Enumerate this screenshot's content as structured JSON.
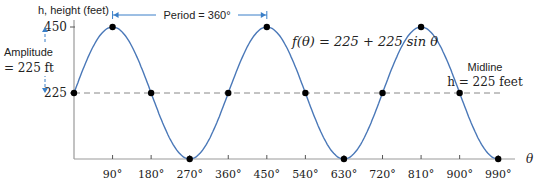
{
  "chart_data": {
    "type": "line",
    "title": "",
    "function_label": "f(θ) = 225 + 225 sin θ",
    "xlabel": "θ",
    "ylabel": "h, height (feet)",
    "xlim": [
      0,
      1000
    ],
    "ylim": [
      0,
      450
    ],
    "x_ticks": [
      "90°",
      "180°",
      "270°",
      "360°",
      "450°",
      "540°",
      "630°",
      "720°",
      "810°",
      "900°",
      "990°"
    ],
    "y_ticks": [
      "450",
      "225"
    ],
    "points": [
      {
        "x": 0,
        "y": 225
      },
      {
        "x": 90,
        "y": 450
      },
      {
        "x": 180,
        "y": 225
      },
      {
        "x": 270,
        "y": 0
      },
      {
        "x": 360,
        "y": 225
      },
      {
        "x": 450,
        "y": 450
      },
      {
        "x": 540,
        "y": 225
      },
      {
        "x": 630,
        "y": 0
      },
      {
        "x": 720,
        "y": 225
      },
      {
        "x": 810,
        "y": 450
      },
      {
        "x": 900,
        "y": 225
      },
      {
        "x": 990,
        "y": 0
      }
    ],
    "annotations": {
      "period": "Period = 360°",
      "amplitude_line1": "Amplitude",
      "amplitude_line2": "= 225 ft",
      "midline_line1": "Midline",
      "midline_line2": "h = 225 feet"
    },
    "colors": {
      "curve": "#4a78b8",
      "annotation": "#3a7fc8",
      "midline": "#888888"
    },
    "grid": false
  }
}
